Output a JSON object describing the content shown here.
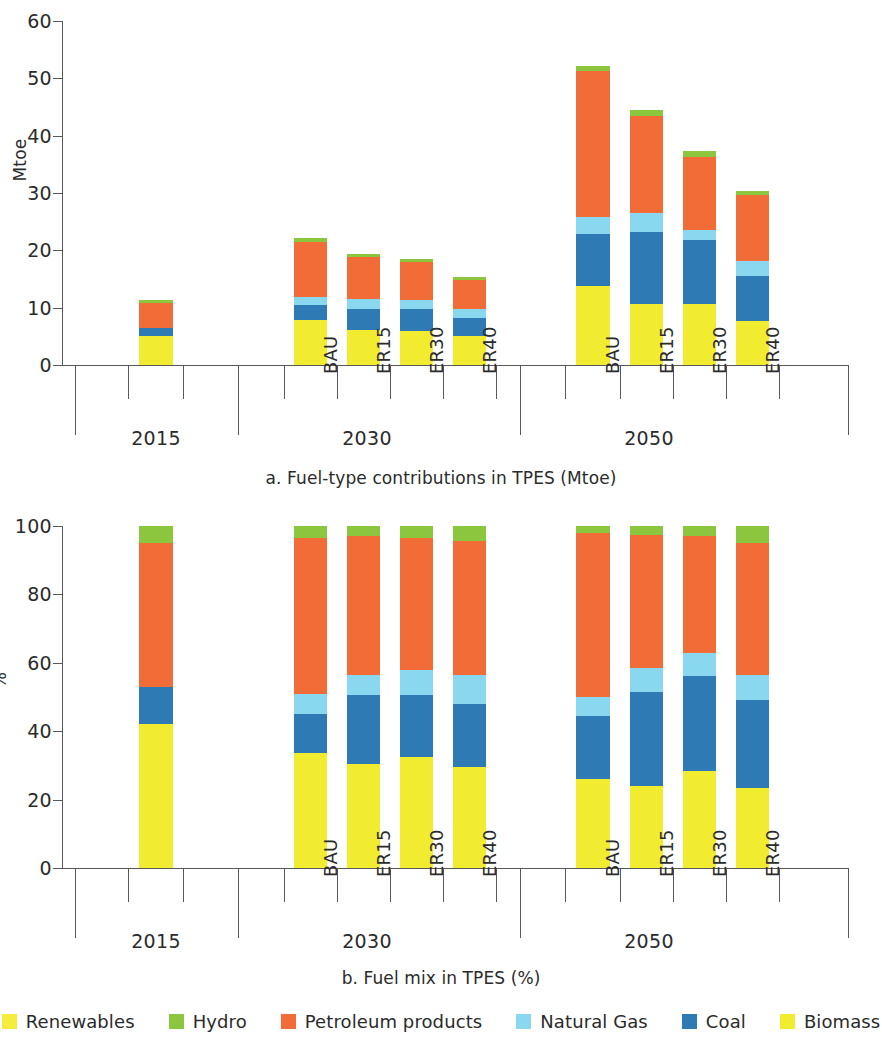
{
  "figure": {
    "panels": [
      {
        "id": "a",
        "caption": "a. Fuel-type contributions in TPES (Mtoe)",
        "ylabel": "Mtoe"
      },
      {
        "id": "b",
        "caption": "b. Fuel mix in TPES (%)",
        "ylabel": "%"
      }
    ]
  },
  "legend": {
    "items": [
      {
        "label": "Renewables",
        "color": "#f6ec3c"
      },
      {
        "label": "Hydro",
        "color": "#8cc63f"
      },
      {
        "label": "Petroleum products",
        "color": "#f26c38"
      },
      {
        "label": "Natural Gas",
        "color": "#89d8ef"
      },
      {
        "label": "Coal",
        "color": "#2e7ab4"
      },
      {
        "label": "Biomass",
        "color": "#f2ec31"
      }
    ]
  },
  "chart_data": [
    {
      "type": "bar",
      "id": "a",
      "stacked": true,
      "title": "a. Fuel-type contributions in TPES (Mtoe)",
      "xlabel": "",
      "ylabel": "Mtoe",
      "ylim": [
        0,
        60
      ],
      "yticks": [
        0,
        10,
        20,
        30,
        40,
        50,
        60
      ],
      "grid": false,
      "legend_position": "bottom",
      "groups": [
        {
          "label": "2015",
          "categories": [
            "2015"
          ]
        },
        {
          "label": "2030",
          "categories": [
            "BAU",
            "ER15",
            "ER30",
            "ER40"
          ]
        },
        {
          "label": "2050",
          "categories": [
            "BAU",
            "ER15",
            "ER30",
            "ER40"
          ]
        }
      ],
      "categories": [
        "2015",
        "BAU",
        "ER15",
        "ER30",
        "ER40",
        "BAU",
        "ER15",
        "ER30",
        "ER40"
      ],
      "series": [
        {
          "name": "Biomass",
          "color": "#f2ec31",
          "values": [
            5.0,
            7.9,
            6.1,
            6.0,
            5.0,
            13.8,
            10.6,
            10.6,
            7.7
          ]
        },
        {
          "name": "Coal",
          "color": "#2e7ab4",
          "values": [
            1.5,
            2.5,
            3.7,
            3.8,
            3.2,
            9.1,
            12.6,
            11.2,
            7.8
          ]
        },
        {
          "name": "Natural Gas",
          "color": "#89d8ef",
          "values": [
            0.0,
            1.5,
            1.7,
            1.6,
            1.5,
            2.9,
            3.3,
            1.7,
            2.7
          ]
        },
        {
          "name": "Petroleum products",
          "color": "#f26c38",
          "values": [
            4.3,
            9.6,
            7.3,
            6.6,
            5.1,
            25.4,
            16.9,
            12.7,
            11.4
          ]
        },
        {
          "name": "Hydro",
          "color": "#8cc63f",
          "values": [
            0.5,
            0.6,
            0.6,
            0.5,
            0.5,
            1.0,
            1.1,
            1.1,
            0.8
          ]
        }
      ],
      "totals": [
        11.3,
        22.1,
        19.4,
        18.5,
        15.3,
        52.2,
        44.5,
        37.3,
        30.4
      ]
    },
    {
      "type": "bar",
      "id": "b",
      "stacked": true,
      "normalized": true,
      "title": "b. Fuel mix in TPES (%)",
      "xlabel": "",
      "ylabel": "%",
      "ylim": [
        0,
        100
      ],
      "yticks": [
        0,
        20,
        40,
        60,
        80,
        100
      ],
      "grid": false,
      "legend_position": "bottom",
      "groups": [
        {
          "label": "2015",
          "categories": [
            "2015"
          ]
        },
        {
          "label": "2030",
          "categories": [
            "BAU",
            "ER15",
            "ER30",
            "ER40"
          ]
        },
        {
          "label": "2050",
          "categories": [
            "BAU",
            "ER15",
            "ER30",
            "ER40"
          ]
        }
      ],
      "categories": [
        "2015",
        "BAU",
        "ER15",
        "ER30",
        "ER40",
        "BAU",
        "ER15",
        "ER30",
        "ER40"
      ],
      "series": [
        {
          "name": "Biomass",
          "color": "#f2ec31",
          "values": [
            42,
            33.5,
            30.5,
            32.5,
            29.5,
            26.0,
            24.0,
            28.5,
            23.5
          ]
        },
        {
          "name": "Coal",
          "color": "#2e7ab4",
          "values": [
            11,
            11.5,
            20.0,
            18.0,
            18.5,
            18.5,
            27.5,
            27.5,
            25.5
          ]
        },
        {
          "name": "Natural Gas",
          "color": "#89d8ef",
          "values": [
            0,
            6.0,
            6.0,
            7.5,
            8.5,
            5.5,
            7.0,
            7.0,
            7.5
          ]
        },
        {
          "name": "Petroleum products",
          "color": "#f26c38",
          "values": [
            42,
            45.5,
            40.5,
            38.5,
            39.0,
            48.0,
            39.0,
            34.0,
            38.5
          ]
        },
        {
          "name": "Hydro",
          "color": "#8cc63f",
          "values": [
            5,
            3.5,
            3.0,
            3.5,
            4.5,
            2.0,
            2.5,
            3.0,
            5.0
          ]
        }
      ],
      "totals": [
        100,
        100,
        100,
        100,
        100,
        100,
        100,
        100,
        100
      ]
    }
  ]
}
